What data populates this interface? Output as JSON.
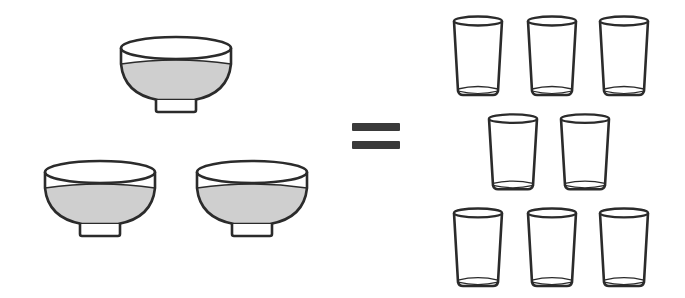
{
  "diagram": {
    "description": "3 bowls of liquid equal 8 glasses",
    "left_side": {
      "label": "bowls",
      "count": 3,
      "items": [
        {
          "name": "bowl",
          "x": 118,
          "y": 34,
          "w": 116,
          "h": 80
        },
        {
          "name": "bowl",
          "x": 42,
          "y": 158,
          "w": 116,
          "h": 80
        },
        {
          "name": "bowl",
          "x": 194,
          "y": 158,
          "w": 116,
          "h": 80
        }
      ]
    },
    "operator": {
      "symbol": "=",
      "name": "equals"
    },
    "right_side": {
      "label": "glasses",
      "count": 8,
      "items": [
        {
          "name": "glass",
          "x": 451,
          "y": 14,
          "w": 54,
          "h": 84
        },
        {
          "name": "glass",
          "x": 525,
          "y": 14,
          "w": 54,
          "h": 84
        },
        {
          "name": "glass",
          "x": 597,
          "y": 14,
          "w": 54,
          "h": 84
        },
        {
          "name": "glass",
          "x": 486,
          "y": 112,
          "w": 54,
          "h": 80
        },
        {
          "name": "glass",
          "x": 558,
          "y": 112,
          "w": 54,
          "h": 80
        },
        {
          "name": "glass",
          "x": 451,
          "y": 206,
          "w": 54,
          "h": 83
        },
        {
          "name": "glass",
          "x": 525,
          "y": 206,
          "w": 54,
          "h": 83
        },
        {
          "name": "glass",
          "x": 597,
          "y": 206,
          "w": 54,
          "h": 83
        }
      ]
    },
    "colors": {
      "outline": "#2b2b2b",
      "liquid": "#cfcfcf",
      "background": "#ffffff",
      "equals": "#3a3a3a"
    }
  }
}
